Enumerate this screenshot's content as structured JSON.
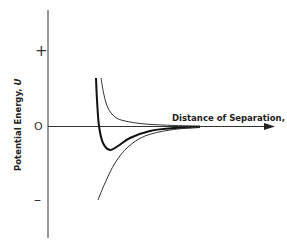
{
  "chart_data": {
    "type": "line",
    "title": "",
    "xlabel": "Distance of Separation, r",
    "ylabel": "Potential Energy, U",
    "y_tick_labels": [
      "+",
      "0",
      "–"
    ],
    "grid": false,
    "legend": null,
    "series": [
      {
        "name": "repulsive energy",
        "style": "thin",
        "description": "positive, decreasing steeply toward zero as r increases",
        "points": [
          [
            101,
            78
          ],
          [
            104,
            95
          ],
          [
            108,
            108
          ],
          [
            115,
            117
          ],
          [
            125,
            121
          ],
          [
            145,
            124
          ],
          [
            175,
            125.5
          ],
          [
            200,
            126
          ]
        ]
      },
      {
        "name": "net potential energy",
        "style": "thick",
        "description": "crosses zero, reaches minimum (potential well), then approaches zero from below",
        "points": [
          [
            96,
            78
          ],
          [
            97,
            100
          ],
          [
            99,
            126
          ],
          [
            103,
            143
          ],
          [
            110,
            150
          ],
          [
            118,
            146
          ],
          [
            130,
            138
          ],
          [
            150,
            131
          ],
          [
            175,
            128
          ],
          [
            200,
            127
          ]
        ]
      },
      {
        "name": "attractive energy",
        "style": "thin",
        "description": "negative, rising toward zero as r increases",
        "points": [
          [
            98,
            200
          ],
          [
            105,
            183
          ],
          [
            115,
            163
          ],
          [
            128,
            147
          ],
          [
            145,
            136
          ],
          [
            170,
            130
          ],
          [
            200,
            127
          ]
        ]
      }
    ]
  },
  "axes": {
    "y_ticks": {
      "plus": "+",
      "zero": "O",
      "minus": "–"
    },
    "x_label_text": "Distance of Separation, ",
    "x_label_var": "r",
    "y_label_text": "Potential Energy, ",
    "y_label_var": "U"
  }
}
